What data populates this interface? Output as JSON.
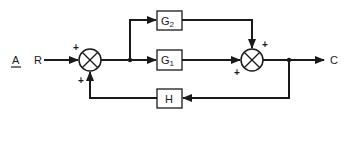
{
  "diagram": {
    "panel_label": "A",
    "input_label": "R",
    "output_label": "C",
    "blocks": {
      "g2": {
        "main": "G",
        "sub": "2"
      },
      "g1": {
        "main": "G",
        "sub": "1"
      },
      "h": {
        "main": "H"
      }
    },
    "summing_junctions": {
      "left": {
        "sign_input": "+",
        "sign_feedback": "+"
      },
      "right": {
        "sign_top": "+",
        "sign_left": "+"
      }
    }
  }
}
